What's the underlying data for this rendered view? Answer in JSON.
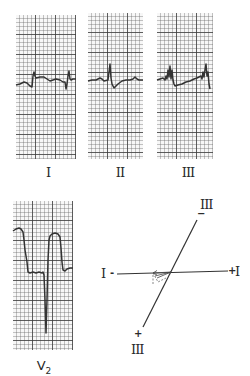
{
  "figure": {
    "strips": [
      {
        "id": "lead-I",
        "label": "I"
      },
      {
        "id": "lead-II",
        "label": "II"
      },
      {
        "id": "lead-III",
        "label": "III"
      },
      {
        "id": "lead-V2",
        "label": "V",
        "label_sub": "2"
      }
    ],
    "axis_diagram": {
      "lead_I_negative_label": "I",
      "lead_I_negative_sign": "-",
      "lead_I_positive_label": "I",
      "lead_I_positive_sign": "+",
      "lead_III_negative_label": "III",
      "lead_III_negative_sign": "−",
      "lead_III_positive_label": "III",
      "lead_III_positive_sign": "+",
      "vector_direction": "left"
    },
    "colors": {
      "trace": "#333333",
      "grid_major": "#3c3c3c",
      "grid_minor": "#5a5a5a",
      "paper": "#f7f7f7"
    }
  }
}
